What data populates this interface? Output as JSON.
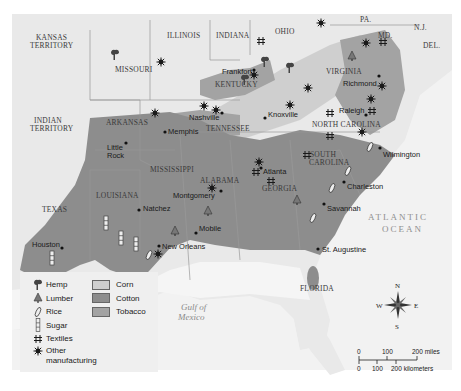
{
  "map": {
    "title": "Southern Economy, 1860 (agriculture & industry)",
    "colors": {
      "background": "#f2f2f2",
      "water": "#f7f7f7",
      "land_base": "#e6e6e6",
      "corn": "#cfcfcf",
      "cotton": "#8d8d8d",
      "tobacco": "#a3a3a3",
      "border": "#9a9a9a"
    },
    "states": [
      {
        "name": "KANSAS",
        "line2": "TERRITORY"
      },
      {
        "name": "MISSOURI"
      },
      {
        "name": "ILLINOIS"
      },
      {
        "name": "INDIANA"
      },
      {
        "name": "OHIO"
      },
      {
        "name": "PA."
      },
      {
        "name": "N.J."
      },
      {
        "name": "DEL."
      },
      {
        "name": "MD."
      },
      {
        "name": "VIRGINIA"
      },
      {
        "name": "KENTUCKY"
      },
      {
        "name": "TENNESSEE"
      },
      {
        "name": "NORTH CAROLINA"
      },
      {
        "name": "SOUTH",
        "line2": "CAROLINA"
      },
      {
        "name": "GEORGIA"
      },
      {
        "name": "ALABAMA"
      },
      {
        "name": "MISSISSIPPI"
      },
      {
        "name": "LOUISIANA"
      },
      {
        "name": "ARKANSAS"
      },
      {
        "name": "TEXAS"
      },
      {
        "name": "INDIAN",
        "line2": "TERRITORY"
      },
      {
        "name": "FLORIDA"
      }
    ],
    "cities": [
      {
        "name": "Frankfort"
      },
      {
        "name": "Richmond"
      },
      {
        "name": "Nashville"
      },
      {
        "name": "Knoxville"
      },
      {
        "name": "Raleigh"
      },
      {
        "name": "Memphis"
      },
      {
        "name": "Little",
        "line2": "Rock"
      },
      {
        "name": "Wilmington"
      },
      {
        "name": "Atlanta"
      },
      {
        "name": "Montgomery"
      },
      {
        "name": "Charleston"
      },
      {
        "name": "Savannah"
      },
      {
        "name": "Natchez"
      },
      {
        "name": "Mobile"
      },
      {
        "name": "New Orleans"
      },
      {
        "name": "Houston"
      },
      {
        "name": "St. Augustine"
      }
    ],
    "rivers": [
      "Missouri R.",
      "Ohio R.",
      "Arkansas R.",
      "Red R.",
      "Cumberland R."
    ],
    "water_bodies": {
      "gulf_line1": "Gulf of",
      "gulf_line2": "Mexico",
      "ocean_line1": "ATLANTIC",
      "ocean_line2": "OCEAN"
    }
  },
  "legend": {
    "symbols": [
      {
        "label": "Hemp",
        "icon": "hemp-icon"
      },
      {
        "label": "Lumber",
        "icon": "tree-icon"
      },
      {
        "label": "Rice",
        "icon": "rice-grain-icon"
      },
      {
        "label": "Sugar",
        "icon": "sugar-cane-icon"
      },
      {
        "label": "Textiles",
        "icon": "textiles-hash-icon"
      },
      {
        "label": "Other",
        "label_line2": "manufacturing",
        "icon": "gear-star-icon"
      }
    ],
    "areas": [
      {
        "label": "Corn",
        "color": "#cfcfcf"
      },
      {
        "label": "Cotton",
        "color": "#8d8d8d"
      },
      {
        "label": "Tobacco",
        "color": "#a3a3a3"
      }
    ]
  },
  "compass": {
    "n": "N",
    "s": "S",
    "e": "E",
    "w": "W"
  },
  "scale": {
    "miles_ticks": [
      "0",
      "100",
      "200 miles"
    ],
    "km_ticks": [
      "0",
      "100",
      "200 kilometers"
    ]
  }
}
